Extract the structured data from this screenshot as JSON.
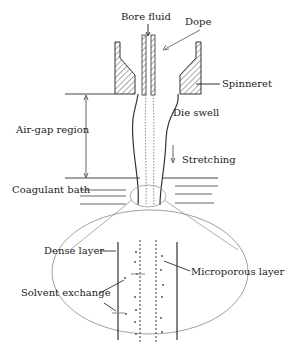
{
  "labels": {
    "bore_fluid": "Bore fluid",
    "dope": "Dope",
    "spinneret": "Spinneret",
    "die_swell": "Die swell",
    "air_gap": "Air-gap region",
    "stretching": "Stretching",
    "coagulant_bath": "Coagulant bath",
    "dense_layer": "Dense layer",
    "microporous_layer": "Microporous layer",
    "solvent_exchange": "Solvent exchange"
  },
  "colors": {
    "line": "#333333",
    "hatch": "#555555",
    "light": "#888888"
  }
}
